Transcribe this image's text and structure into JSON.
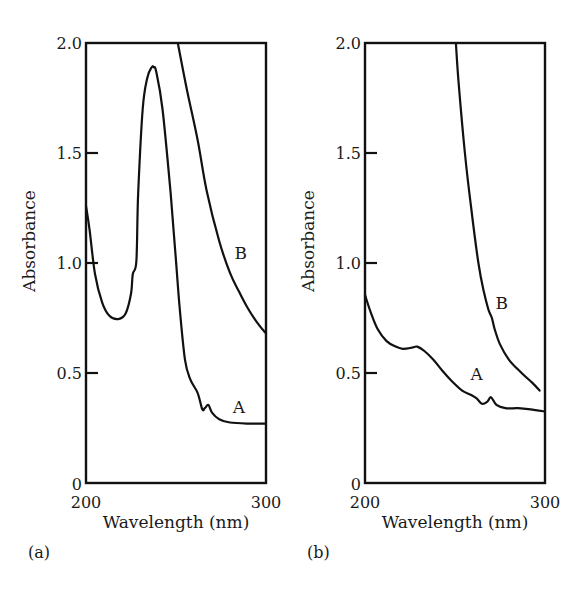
{
  "chart_data": [
    {
      "type": "line",
      "panel_label": "(a)",
      "title": "",
      "xlabel": "Wavelength (nm)",
      "ylabel": "Absorbance",
      "xlim": [
        200,
        300
      ],
      "ylim": [
        0,
        2.0
      ],
      "xticks": [
        "200",
        "300"
      ],
      "yticks": [
        "0",
        "0.5",
        "1.0",
        "1.5",
        "2.0"
      ],
      "grid": false,
      "legend": "inline curve labels",
      "series": [
        {
          "name": "A",
          "label_pos": [
            285,
            0.32
          ],
          "x": [
            200,
            202,
            205,
            209,
            213,
            218,
            222,
            225,
            226,
            228,
            229,
            231.5,
            234,
            236.5,
            237.6,
            239,
            242.5,
            247,
            250,
            252,
            255,
            258,
            262,
            264.6,
            266,
            268,
            270,
            274,
            280,
            290,
            300
          ],
          "y": [
            1.26,
            1.15,
            0.95,
            0.82,
            0.76,
            0.745,
            0.77,
            0.86,
            0.95,
            1.01,
            1.32,
            1.7,
            1.84,
            1.89,
            1.89,
            1.87,
            1.7,
            1.32,
            1.01,
            0.8,
            0.56,
            0.47,
            0.41,
            0.335,
            0.34,
            0.355,
            0.32,
            0.29,
            0.275,
            0.27,
            0.27
          ]
        },
        {
          "name": "B",
          "label_pos": [
            286,
            1.02
          ],
          "x": [
            251,
            256,
            262,
            267,
            274,
            280,
            285,
            289.5,
            295,
            300
          ],
          "y": [
            2.0,
            1.79,
            1.56,
            1.33,
            1.1,
            0.955,
            0.87,
            0.8,
            0.73,
            0.68
          ]
        }
      ]
    },
    {
      "type": "line",
      "panel_label": "(b)",
      "title": "",
      "xlabel": "Wavelength (nm)",
      "ylabel": "Absorbance",
      "xlim": [
        200,
        300
      ],
      "ylim": [
        0,
        2.0
      ],
      "xticks": [
        "200",
        "300"
      ],
      "yticks": [
        "0",
        "0.5",
        "1.0",
        "1.5",
        "2.0"
      ],
      "grid": false,
      "legend": "inline curve labels",
      "series": [
        {
          "name": "A",
          "label_pos": [
            262,
            0.47
          ],
          "x": [
            200,
            203,
            207,
            212,
            217,
            221,
            226,
            229,
            233,
            238,
            243,
            248,
            254,
            259,
            262,
            265,
            268,
            270,
            273,
            278,
            285,
            292,
            300
          ],
          "y": [
            0.855,
            0.78,
            0.7,
            0.645,
            0.62,
            0.61,
            0.615,
            0.62,
            0.6,
            0.56,
            0.51,
            0.465,
            0.42,
            0.4,
            0.385,
            0.36,
            0.37,
            0.39,
            0.355,
            0.34,
            0.34,
            0.335,
            0.325
          ]
        },
        {
          "name": "B",
          "label_pos": [
            276,
            0.79
          ],
          "x": [
            250.5,
            252,
            255.5,
            259,
            263,
            266,
            268.5,
            270.5,
            272,
            275,
            280,
            287,
            293,
            297
          ],
          "y": [
            2.0,
            1.82,
            1.5,
            1.25,
            1.0,
            0.87,
            0.79,
            0.75,
            0.7,
            0.63,
            0.56,
            0.5,
            0.455,
            0.42
          ]
        }
      ]
    }
  ],
  "layout": {
    "panels": [
      {
        "left": 86,
        "right": 266,
        "top": 43,
        "bottom": 483
      },
      {
        "left": 365,
        "right": 545,
        "top": 43,
        "bottom": 483
      }
    ]
  }
}
